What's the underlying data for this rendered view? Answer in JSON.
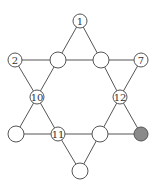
{
  "diagram": {
    "type": "star-of-david-number-puzzle",
    "colors": {
      "line": "#555555",
      "node_fill": "#ffffff",
      "shaded_fill": "#8a8a8a",
      "text": "#333333"
    },
    "nodes": [
      {
        "id": "top",
        "label": "1",
        "x": 80,
        "y": 21,
        "r": 7,
        "shaded": false
      },
      {
        "id": "upper-left",
        "label": "2",
        "x": 15,
        "y": 60,
        "r": 7,
        "shaded": false
      },
      {
        "id": "upper-inner-left",
        "label": "",
        "x": 58,
        "y": 60,
        "r": 8,
        "shaded": false
      },
      {
        "id": "upper-inner-right",
        "label": "",
        "x": 101,
        "y": 60,
        "r": 8,
        "shaded": false
      },
      {
        "id": "upper-right",
        "label": "7",
        "x": 141,
        "y": 60,
        "r": 7,
        "shaded": false
      },
      {
        "id": "mid-left",
        "label": "10",
        "x": 37,
        "y": 97,
        "r": 7,
        "shaded": false
      },
      {
        "id": "mid-right",
        "label": "12",
        "x": 120,
        "y": 97,
        "r": 7,
        "shaded": false
      },
      {
        "id": "lower-left",
        "label": "",
        "x": 16,
        "y": 134,
        "r": 8,
        "shaded": false
      },
      {
        "id": "lower-inner-left",
        "label": "11",
        "x": 58,
        "y": 134,
        "r": 7,
        "shaded": false
      },
      {
        "id": "lower-inner-right",
        "label": "",
        "x": 100,
        "y": 134,
        "r": 8,
        "shaded": false
      },
      {
        "id": "lower-right",
        "label": "",
        "x": 141,
        "y": 134,
        "r": 7,
        "shaded": true
      },
      {
        "id": "bottom",
        "label": "",
        "x": 80,
        "y": 171,
        "r": 8,
        "shaded": false
      }
    ],
    "edges": [
      [
        "top",
        "upper-inner-left"
      ],
      [
        "top",
        "upper-inner-right"
      ],
      [
        "upper-left",
        "upper-inner-left"
      ],
      [
        "upper-inner-left",
        "upper-inner-right"
      ],
      [
        "upper-inner-right",
        "upper-right"
      ],
      [
        "upper-left",
        "mid-left"
      ],
      [
        "upper-inner-left",
        "mid-left"
      ],
      [
        "upper-right",
        "mid-right"
      ],
      [
        "upper-inner-right",
        "mid-right"
      ],
      [
        "mid-left",
        "lower-left"
      ],
      [
        "mid-left",
        "lower-inner-left"
      ],
      [
        "mid-right",
        "lower-inner-right"
      ],
      [
        "mid-right",
        "lower-right"
      ],
      [
        "lower-left",
        "lower-inner-left"
      ],
      [
        "lower-inner-left",
        "lower-inner-right"
      ],
      [
        "lower-inner-right",
        "lower-right"
      ],
      [
        "lower-inner-left",
        "bottom"
      ],
      [
        "lower-inner-right",
        "bottom"
      ]
    ]
  }
}
